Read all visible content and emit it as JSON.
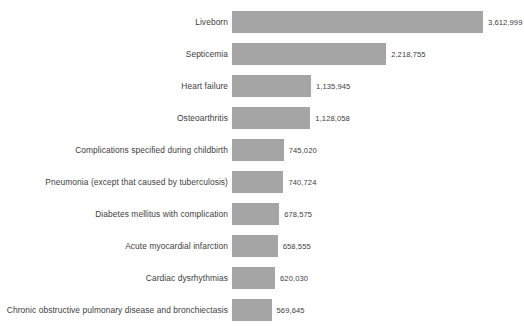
{
  "chart_data": {
    "type": "bar",
    "orientation": "horizontal",
    "title": "",
    "subtitle": "",
    "xlabel": "",
    "ylabel": "",
    "grid": false,
    "legend": null,
    "legend_position": "none",
    "xlim": [
      0,
      3612999
    ],
    "bar_color": "#a5a5a5",
    "text_color": "#404040",
    "background_color": "#ffffff",
    "value_label_format": "comma-separated integers",
    "categories": [
      "Liveborn",
      "Septicemia",
      "Heart failure",
      "Osteoarthritis",
      "Complications specified during childbirth",
      "Pneumonia (except that caused by tuberculosis)",
      "Diabetes mellitus with complication",
      "Acute myocardial infarction",
      "Cardiac dysrhythmias",
      "Chronic obstructive pulmonary disease and bronchiectasis"
    ],
    "values": [
      3612999,
      2218755,
      1135945,
      1128058,
      745020,
      740724,
      678575,
      658555,
      620030,
      569645
    ],
    "value_labels": [
      "3,612,999",
      "2,218,755",
      "1,135,945",
      "1,128,058",
      "745,020",
      "740,724",
      "678,575",
      "658,555",
      "620,030",
      "569,645"
    ]
  }
}
